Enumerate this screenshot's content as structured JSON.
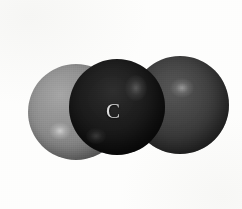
{
  "figure": {
    "type": "space-filling-molecular-model",
    "background_color": "#fdfdfc",
    "width": 242,
    "height": 209
  },
  "atoms": [
    {
      "id": "left-atom",
      "label": "",
      "shade": "light-gray",
      "color": "#8b8b8b",
      "center_x": 76,
      "center_y": 112,
      "radius": 48,
      "z": 1,
      "highlight": {
        "x": 60,
        "y": 131,
        "rx": 11,
        "ry": 9
      }
    },
    {
      "id": "right-atom",
      "label": "",
      "shade": "medium-gray",
      "color": "#3e3e3e",
      "center_x": 180,
      "center_y": 105,
      "radius": 49,
      "z": 2,
      "highlight": {
        "x": 182,
        "y": 88,
        "rx": 12,
        "ry": 10
      }
    },
    {
      "id": "center-atom",
      "label": "C",
      "shade": "near-black",
      "color": "#1a1a1a",
      "center_x": 117,
      "center_y": 107,
      "radius": 48,
      "z": 3,
      "label_x": 113,
      "label_y": 112,
      "label_color": "#dcdcdc",
      "highlight": {
        "x": 136,
        "y": 88,
        "rx": 11,
        "ry": 13
      },
      "highlight_secondary": {
        "x": 96,
        "y": 136,
        "rx": 10,
        "ry": 8
      }
    }
  ]
}
